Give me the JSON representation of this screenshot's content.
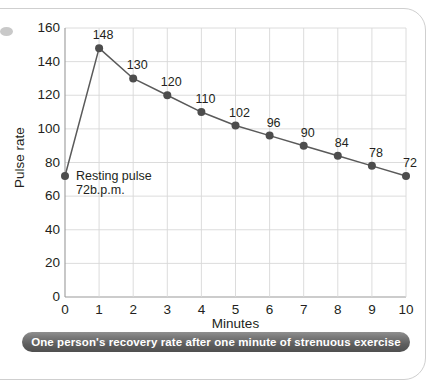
{
  "caption": "One person's recovery rate after one minute of strenuous exercise",
  "annotation": {
    "line1": "Resting pulse",
    "line2": "72b.p.m."
  },
  "colors": {
    "line": "#5a5a5a",
    "marker": "#4d4d4d",
    "grid": "#d8d8d8",
    "axis": "#9a9a9a",
    "text": "#231f20",
    "caption_bg": "#5e5e5e",
    "caption_text": "#ffffff",
    "panel_border": "#cfcfcf"
  },
  "chart_data": {
    "type": "line",
    "title": "",
    "subtitle": "",
    "xlabel": "Minutes",
    "ylabel": "Pulse rate",
    "x": [
      0,
      1,
      2,
      3,
      4,
      5,
      6,
      7,
      8,
      9,
      10
    ],
    "values": [
      72,
      148,
      130,
      120,
      110,
      102,
      96,
      90,
      84,
      78,
      72
    ],
    "point_labels": [
      "",
      "148",
      "130",
      "120",
      "110",
      "102",
      "96",
      "90",
      "84",
      "78",
      "72"
    ],
    "xticks": [
      "0",
      "1",
      "2",
      "3",
      "4",
      "5",
      "6",
      "7",
      "8",
      "9",
      "10"
    ],
    "yticks": [
      "0",
      "20",
      "40",
      "60",
      "80",
      "100",
      "120",
      "140",
      "160"
    ],
    "xlim": [
      0,
      10
    ],
    "ylim": [
      0,
      160
    ],
    "grid": true,
    "legend": "none",
    "annotations": [
      {
        "x": 0,
        "y": 72,
        "text": "Resting pulse 72b.p.m."
      }
    ]
  }
}
